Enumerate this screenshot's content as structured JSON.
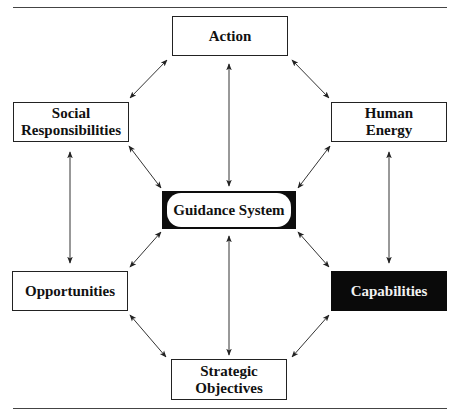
{
  "diagram": {
    "nodes": {
      "action": {
        "label": "Action"
      },
      "social": {
        "line1": "Social",
        "line2": "Responsibilities"
      },
      "human": {
        "line1": "Human",
        "line2": "Energy"
      },
      "guidance": {
        "label": "Guidance System"
      },
      "opportunities": {
        "label": "Opportunities"
      },
      "capabilities": {
        "label": "Capabilities"
      },
      "strategic": {
        "line1": "Strategic",
        "line2": "Objectives"
      }
    },
    "edges": [
      {
        "from": "Action",
        "to": "Social Responsibilities",
        "type": "bidirectional"
      },
      {
        "from": "Action",
        "to": "Human Energy",
        "type": "bidirectional"
      },
      {
        "from": "Action",
        "to": "Guidance System",
        "type": "bidirectional"
      },
      {
        "from": "Social Responsibilities",
        "to": "Guidance System",
        "type": "bidirectional"
      },
      {
        "from": "Human Energy",
        "to": "Guidance System",
        "type": "bidirectional"
      },
      {
        "from": "Social Responsibilities",
        "to": "Opportunities",
        "type": "bidirectional"
      },
      {
        "from": "Human Energy",
        "to": "Capabilities",
        "type": "bidirectional"
      },
      {
        "from": "Opportunities",
        "to": "Guidance System",
        "type": "bidirectional"
      },
      {
        "from": "Capabilities",
        "to": "Guidance System",
        "type": "bidirectional"
      },
      {
        "from": "Guidance System",
        "to": "Strategic Objectives",
        "type": "bidirectional"
      },
      {
        "from": "Opportunities",
        "to": "Strategic Objectives",
        "type": "bidirectional"
      },
      {
        "from": "Capabilities",
        "to": "Strategic Objectives",
        "type": "bidirectional"
      }
    ],
    "colors": {
      "line": "#222222",
      "highlight_fill": "#0a0a0a",
      "highlight_text": "#f2f2f2"
    }
  }
}
